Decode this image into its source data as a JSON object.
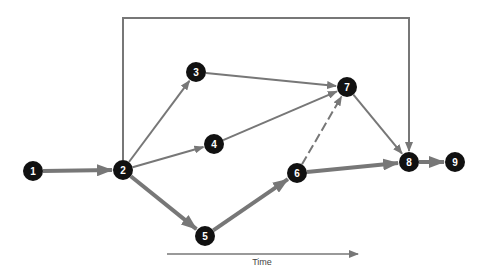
{
  "diagram": {
    "type": "network-diagram",
    "colors": {
      "node": "#111111",
      "edge": "#777777",
      "node_text": "#ffffff"
    },
    "nodes": [
      {
        "id": "1",
        "label": "1",
        "x": 33,
        "y": 171
      },
      {
        "id": "2",
        "label": "2",
        "x": 123,
        "y": 170
      },
      {
        "id": "3",
        "label": "3",
        "x": 196,
        "y": 72
      },
      {
        "id": "4",
        "label": "4",
        "x": 214,
        "y": 144
      },
      {
        "id": "5",
        "label": "5",
        "x": 205,
        "y": 236
      },
      {
        "id": "6",
        "label": "6",
        "x": 297,
        "y": 173
      },
      {
        "id": "7",
        "label": "7",
        "x": 347,
        "y": 87
      },
      {
        "id": "8",
        "label": "8",
        "x": 409,
        "y": 162
      },
      {
        "id": "9",
        "label": "9",
        "x": 455,
        "y": 162
      }
    ],
    "edges": [
      {
        "from": "1",
        "to": "2",
        "style": "thick"
      },
      {
        "from": "2",
        "to": "3",
        "style": "normal"
      },
      {
        "from": "2",
        "to": "4",
        "style": "normal"
      },
      {
        "from": "2",
        "to": "5",
        "style": "thick"
      },
      {
        "from": "3",
        "to": "7",
        "style": "normal"
      },
      {
        "from": "4",
        "to": "7",
        "style": "normal"
      },
      {
        "from": "5",
        "to": "6",
        "style": "thick"
      },
      {
        "from": "6",
        "to": "7",
        "style": "dashed"
      },
      {
        "from": "6",
        "to": "8",
        "style": "thick"
      },
      {
        "from": "7",
        "to": "8",
        "style": "normal"
      },
      {
        "from": "8",
        "to": "9",
        "style": "thick"
      },
      {
        "from": "2",
        "to": "8",
        "style": "bracket",
        "route": "over-top"
      }
    ],
    "time_axis": {
      "label": "Time"
    }
  }
}
